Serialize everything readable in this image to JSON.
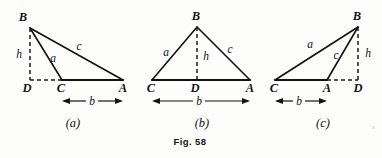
{
  "figure": {
    "caption": "Fig. 58",
    "panels": [
      {
        "id": "a",
        "label": "(a)",
        "vertices": {
          "A": "A",
          "B": "B",
          "C": "C",
          "D": "D"
        },
        "sides": {
          "a": "a",
          "c": "c",
          "h": "h",
          "b": "b"
        },
        "description": "obtuse triangle with foot of altitude D outside segment CA"
      },
      {
        "id": "b",
        "label": "(b)",
        "vertices": {
          "A": "A",
          "B": "B",
          "C": "C",
          "D": "D"
        },
        "sides": {
          "a": "a",
          "c": "c",
          "h": "h",
          "b": "b"
        },
        "description": "acute triangle with foot of altitude D between C and A"
      },
      {
        "id": "c",
        "label": "(c)",
        "vertices": {
          "A": "A",
          "B": "B",
          "C": "C",
          "D": "D"
        },
        "sides": {
          "a": "a",
          "c": "c",
          "h": "h",
          "b": "b"
        },
        "description": "obtuse triangle with foot of altitude D beyond A"
      }
    ]
  },
  "colors": {
    "ink": "#121212",
    "paper": "#fdfdfb"
  }
}
